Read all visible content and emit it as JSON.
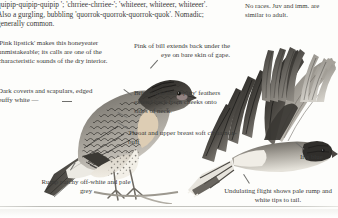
{
  "page": {
    "background_color": "#fdfdfb",
    "text_color": "#3a3a38",
    "leader_line_color": "#6f6f6c"
  },
  "voice": {
    "text": "quipip-quipip-quipip '; 'chrriee-chrriee-'; 'whiteeer, whiteeer, whiteeer'. Also a gurgling, bubbling 'quorrok-quorrok-quorrok-quok'. Nomadic; generally common."
  },
  "races": {
    "text": "No races. Juv and imm. are similar to adult."
  },
  "captions": [
    {
      "id": "lipstick",
      "text": "'Pink lipstick' makes this honeyeater unmistakeable; its calls are one of the characteristic sounds of the dry interior."
    },
    {
      "id": "coverts",
      "text": "Dark coverts and scapulars, edged buffy white  —"
    },
    {
      "id": "rump",
      "text": "Rump patchy off-white and pale grey"
    },
    {
      "id": "bill-pink",
      "text": "Pink of bill extends back under the eye on bare skin of gape."
    },
    {
      "id": "bristle",
      "text": "Bristle-like fine 'spiny' feathers extend back from cheeks onto sides of neck."
    },
    {
      "id": "throat",
      "text": "Throat and upper breast soft cinnamon-buff"
    },
    {
      "id": "iris",
      "text": "Iris blue"
    },
    {
      "id": "undulating",
      "text": "Undulating flight shows pale rump and white tips to tail."
    }
  ],
  "illustrations": [
    {
      "id": "perched-bird",
      "name": "perched-honeyeater-illustration"
    },
    {
      "id": "flying-bird",
      "name": "flying-honeyeater-illustration"
    },
    {
      "id": "wing-detail",
      "name": "wing-feathers-detail-illustration"
    }
  ]
}
